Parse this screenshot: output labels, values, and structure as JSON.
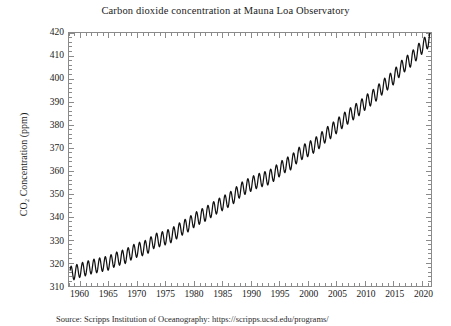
{
  "title": "Carbon dioxide concentration at Mauna Loa Observatory",
  "source_caption": "Source: Scripps Institution of Oceanography: https://scripps.ucsd.edu/programs/",
  "chart_data": {
    "type": "line",
    "title": "Carbon dioxide concentration at Mauna Loa Observatory",
    "xlabel": "",
    "ylabel": "CO₂ Concentration (ppm)",
    "xlim": [
      1958,
      2021.5
    ],
    "ylim": [
      310,
      420
    ],
    "xticks": [
      1960,
      1965,
      1970,
      1975,
      1980,
      1985,
      1990,
      1995,
      2000,
      2005,
      2010,
      2015,
      2020
    ],
    "yticks": [
      310,
      320,
      330,
      340,
      350,
      360,
      370,
      380,
      390,
      400,
      410,
      420
    ],
    "xtick_labels": [
      "1960",
      "1965",
      "1970",
      "1975",
      "1980",
      "1985",
      "1990",
      "1995",
      "2000",
      "2005",
      "2010",
      "2015",
      "2020"
    ],
    "ytick_labels": [
      "310",
      "320",
      "330",
      "340",
      "350",
      "360",
      "370",
      "380",
      "390",
      "400",
      "410",
      "420"
    ],
    "x_minor_tick_interval": 1,
    "y_minor_tick_interval": 2,
    "grid": false,
    "legend": false,
    "line_color": "#111111",
    "seasonal_amplitude_ppm": 6.2,
    "series": [
      {
        "name": "Monthly mean CO2 (ppm)",
        "annual_mean_x": [
          1958,
          1959,
          1960,
          1961,
          1962,
          1963,
          1964,
          1965,
          1966,
          1967,
          1968,
          1969,
          1970,
          1971,
          1972,
          1973,
          1974,
          1975,
          1976,
          1977,
          1978,
          1979,
          1980,
          1981,
          1982,
          1983,
          1984,
          1985,
          1986,
          1987,
          1988,
          1989,
          1990,
          1991,
          1992,
          1993,
          1994,
          1995,
          1996,
          1997,
          1998,
          1999,
          2000,
          2001,
          2002,
          2003,
          2004,
          2005,
          2006,
          2007,
          2008,
          2009,
          2010,
          2011,
          2012,
          2013,
          2014,
          2015,
          2016,
          2017,
          2018,
          2019,
          2020,
          2021
        ],
        "annual_mean_y": [
          315.3,
          315.9,
          316.9,
          317.6,
          318.4,
          318.9,
          319.5,
          320.0,
          321.4,
          322.2,
          323.0,
          324.6,
          325.7,
          326.3,
          327.5,
          329.7,
          330.2,
          331.1,
          332.0,
          333.8,
          335.4,
          336.8,
          338.7,
          340.1,
          341.4,
          343.0,
          344.6,
          346.0,
          347.4,
          349.2,
          351.6,
          353.1,
          354.4,
          355.6,
          356.4,
          357.1,
          358.8,
          360.8,
          362.6,
          363.7,
          366.6,
          368.3,
          369.5,
          371.0,
          373.1,
          375.6,
          377.4,
          379.6,
          381.8,
          383.7,
          385.6,
          387.4,
          389.8,
          391.6,
          393.8,
          396.5,
          398.6,
          400.8,
          404.2,
          406.5,
          408.5,
          411.4,
          414.2,
          416.5
        ]
      }
    ]
  }
}
